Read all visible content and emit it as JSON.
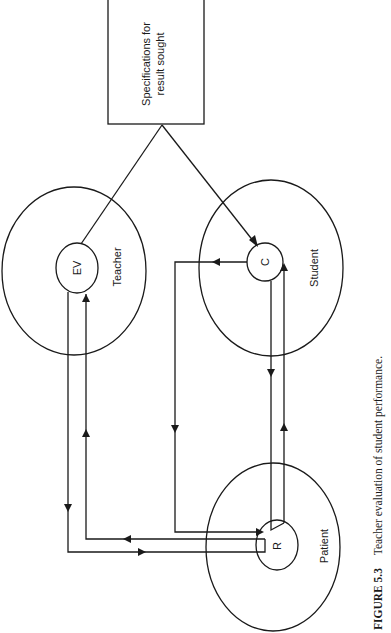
{
  "figure": {
    "caption_number": "FIGURE 5.3",
    "caption_text": "Teacher evaluation of student performance."
  },
  "nodes": {
    "spec_box": {
      "line1": "Specifications for",
      "line2": "result sought"
    },
    "teacher": {
      "label": "Teacher",
      "inner": "EV"
    },
    "student": {
      "label": "Student",
      "inner": "C"
    },
    "patient": {
      "label": "Patient",
      "inner": "R"
    }
  },
  "edges": [
    {
      "from": "spec_box",
      "to": "EV",
      "arrow": "none"
    },
    {
      "from": "spec_box",
      "to": "C",
      "arrow": "to"
    },
    {
      "from": "EV",
      "to": "R",
      "arrow": "to"
    },
    {
      "from": "R",
      "to": "EV",
      "arrow": "to"
    },
    {
      "from": "C",
      "to": "R",
      "arrow": "to"
    },
    {
      "from": "C",
      "to": "R",
      "arrow": "to",
      "note": "left loop"
    },
    {
      "from": "R",
      "to": "C",
      "arrow": "to"
    }
  ],
  "colors": {
    "ink": "#1a1a1a",
    "background": "#ffffff"
  }
}
